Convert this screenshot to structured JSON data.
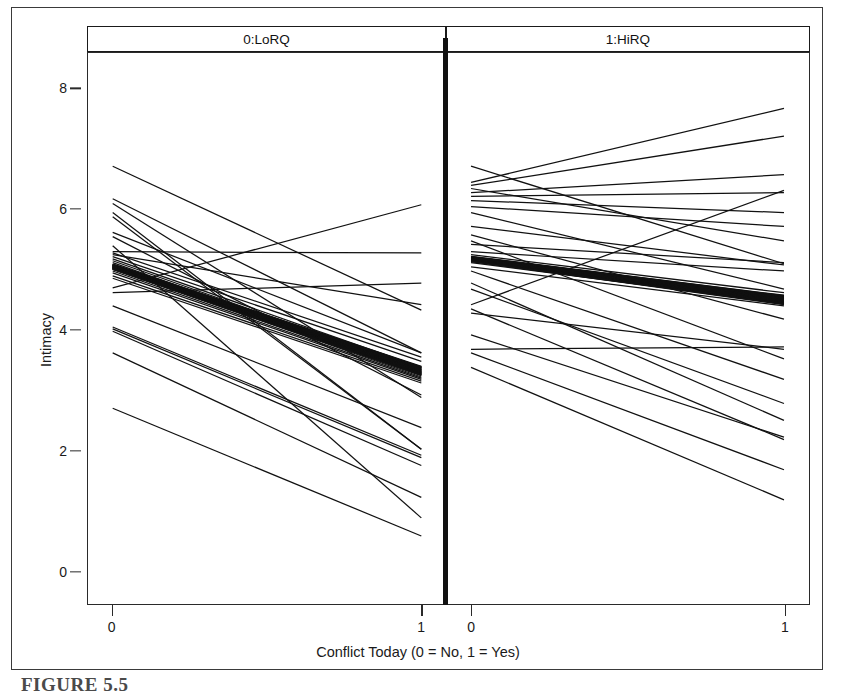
{
  "figure": {
    "caption": "FIGURE 5.5",
    "background": "#ffffff",
    "line_color": "#111111"
  },
  "chart_data": {
    "type": "line",
    "title": "",
    "subtitle": "",
    "xlabel": "Conflict Today (0 = No, 1 = Yes)",
    "ylabel": "Intimacy",
    "xlim": [
      -0.08,
      1.08
    ],
    "ylim": [
      -0.55,
      8.6
    ],
    "x": [
      0,
      1
    ],
    "xticks": [
      0,
      1
    ],
    "xticklabels": [
      "0",
      "1"
    ],
    "yticks": [
      0,
      2,
      4,
      6,
      8
    ],
    "yticklabels": [
      "0",
      "2",
      "4",
      "6",
      "8"
    ],
    "grid": false,
    "legend": "none",
    "panel_layout": "1x2 trellis",
    "panels": [
      {
        "id": "lorq",
        "strip_label": "0:LoRQ",
        "average_line": {
          "name": "Fixed-effect average (bold bundle)",
          "y_start": 5.05,
          "y_end": 3.32,
          "slope": -1.73,
          "stroke_width": 9
        },
        "series": [
          {
            "name": "s01",
            "values": [
              6.72,
              4.33
            ]
          },
          {
            "name": "s02",
            "values": [
              6.18,
              3.62
            ]
          },
          {
            "name": "s03",
            "values": [
              6.1,
              2.88
            ]
          },
          {
            "name": "s04",
            "values": [
              5.95,
              2.02
            ]
          },
          {
            "name": "s05",
            "values": [
              5.3,
              5.28
            ]
          },
          {
            "name": "s06",
            "values": [
              5.28,
              3.55
            ]
          },
          {
            "name": "s07",
            "values": [
              5.25,
              4.42
            ]
          },
          {
            "name": "s08",
            "values": [
              5.22,
              3.48
            ]
          },
          {
            "name": "s09",
            "values": [
              5.18,
              3.38
            ]
          },
          {
            "name": "s10",
            "values": [
              5.15,
              3.34
            ]
          },
          {
            "name": "s11",
            "values": [
              5.12,
              3.3
            ]
          },
          {
            "name": "s12",
            "values": [
              5.08,
              3.28
            ]
          },
          {
            "name": "s13",
            "values": [
              5.05,
              3.25
            ]
          },
          {
            "name": "s14",
            "values": [
              5.02,
              3.22
            ]
          },
          {
            "name": "s15",
            "values": [
              4.98,
              3.2
            ]
          },
          {
            "name": "s16",
            "values": [
              4.95,
              3.18
            ]
          },
          {
            "name": "s17",
            "values": [
              4.9,
              3.15
            ]
          },
          {
            "name": "s18",
            "values": [
              4.86,
              3.12
            ]
          },
          {
            "name": "s19",
            "values": [
              4.7,
              6.08
            ]
          },
          {
            "name": "s20",
            "values": [
              4.62,
              4.78
            ]
          },
          {
            "name": "s21",
            "values": [
              4.4,
              2.38
            ]
          },
          {
            "name": "s22",
            "values": [
              4.05,
              1.92
            ]
          },
          {
            "name": "s23",
            "values": [
              4.02,
              1.88
            ]
          },
          {
            "name": "s24",
            "values": [
              3.98,
              1.75
            ]
          },
          {
            "name": "s25",
            "values": [
              3.62,
              1.22
            ]
          },
          {
            "name": "s26",
            "values": [
              5.55,
              2.92
            ]
          },
          {
            "name": "s27",
            "values": [
              5.62,
              3.62
            ]
          },
          {
            "name": "s28",
            "values": [
              2.7,
              0.58
            ]
          },
          {
            "name": "s29",
            "values": [
              5.88,
              2.02
            ]
          },
          {
            "name": "s30",
            "values": [
              5.4,
              0.88
            ]
          }
        ]
      },
      {
        "id": "hirq",
        "strip_label": "1:HiRQ",
        "average_line": {
          "name": "Fixed-effect average (bold bundle)",
          "y_start": 5.18,
          "y_end": 4.5,
          "slope": -0.68,
          "stroke_width": 9
        },
        "series": [
          {
            "name": "h01",
            "values": [
              6.72,
              5.1
            ]
          },
          {
            "name": "h02",
            "values": [
              6.45,
              7.68
            ]
          },
          {
            "name": "h03",
            "values": [
              6.4,
              7.22
            ]
          },
          {
            "name": "h04",
            "values": [
              6.35,
              5.48
            ]
          },
          {
            "name": "h05",
            "values": [
              6.28,
              6.58
            ]
          },
          {
            "name": "h06",
            "values": [
              6.22,
              6.28
            ]
          },
          {
            "name": "h07",
            "values": [
              6.15,
              5.95
            ]
          },
          {
            "name": "h08",
            "values": [
              6.05,
              5.72
            ]
          },
          {
            "name": "h09",
            "values": [
              5.95,
              4.68
            ]
          },
          {
            "name": "h10",
            "values": [
              5.72,
              5.08
            ]
          },
          {
            "name": "h11",
            "values": [
              5.58,
              4.18
            ]
          },
          {
            "name": "h12",
            "values": [
              5.48,
              3.52
            ]
          },
          {
            "name": "h13",
            "values": [
              5.42,
              5.12
            ]
          },
          {
            "name": "h14",
            "values": [
              5.3,
              4.98
            ]
          },
          {
            "name": "h15",
            "values": [
              5.25,
              4.62
            ]
          },
          {
            "name": "h16",
            "values": [
              5.2,
              4.55
            ]
          },
          {
            "name": "h17",
            "values": [
              5.18,
              4.52
            ]
          },
          {
            "name": "h18",
            "values": [
              5.15,
              4.48
            ]
          },
          {
            "name": "h19",
            "values": [
              5.12,
              4.45
            ]
          },
          {
            "name": "h20",
            "values": [
              5.05,
              4.4
            ]
          },
          {
            "name": "h21",
            "values": [
              4.98,
              3.18
            ]
          },
          {
            "name": "h22",
            "values": [
              4.78,
              2.5
            ]
          },
          {
            "name": "h23",
            "values": [
              4.68,
              2.78
            ]
          },
          {
            "name": "h24",
            "values": [
              4.42,
              6.32
            ]
          },
          {
            "name": "h25",
            "values": [
              4.35,
              2.18
            ]
          },
          {
            "name": "h26",
            "values": [
              4.28,
              3.68
            ]
          },
          {
            "name": "h27",
            "values": [
              3.92,
              2.22
            ]
          },
          {
            "name": "h28",
            "values": [
              3.68,
              3.72
            ]
          },
          {
            "name": "h29",
            "values": [
              3.62,
              1.68
            ]
          },
          {
            "name": "h30",
            "values": [
              3.38,
              1.18
            ]
          }
        ]
      }
    ]
  }
}
